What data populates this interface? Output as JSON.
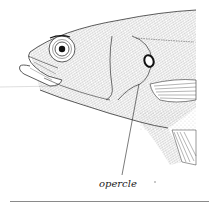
{
  "figure": {
    "labels": [
      {
        "id": "opercle",
        "text": "opercle"
      }
    ],
    "colors": {
      "ink": "#222222",
      "stipple": "#555555",
      "guide_line": "#c8c8c8",
      "rule": "#8a8a8a",
      "background": "#ffffff"
    }
  }
}
